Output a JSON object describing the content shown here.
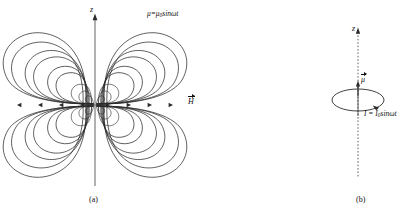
{
  "figure": {
    "background_color": "#ffffff",
    "ink_color": "#2b2b2b",
    "width": 413,
    "height": 213
  },
  "panel_a": {
    "caption": "(a)",
    "axis_label": "z",
    "axis_type": "solid",
    "moment_label_prefix": "μ=μ",
    "moment_label_sub": "0",
    "moment_label_suffix": "sinωt",
    "field_label": "H",
    "description": "radiation field pattern of an oscillating magnetic dipole",
    "axis_x": 95,
    "equator_y": 105,
    "lobe_count_per_side": 4,
    "equator_arrow_count_per_side": 4
  },
  "panel_b": {
    "caption": "(b)",
    "axis_label": "z",
    "axis_type": "dashed",
    "moment_label": "μ",
    "current_label_prefix": "I = I",
    "current_label_sub": "0",
    "current_label_suffix": "sinωt",
    "description": "circular current loop carrying alternating current",
    "axis_x": 358,
    "loop_center_y": 100,
    "loop_rx": 26,
    "loop_ry": 11
  }
}
